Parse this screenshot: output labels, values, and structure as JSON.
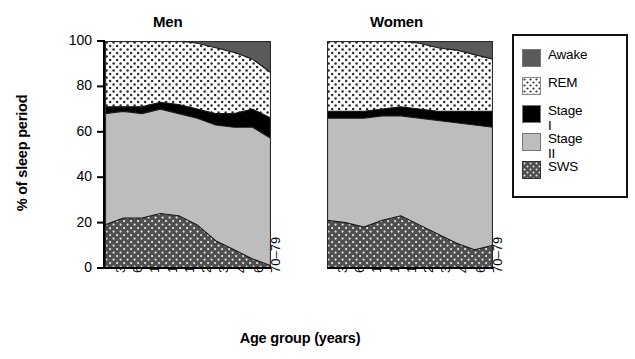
{
  "chart_data": {
    "type": "area",
    "title": "",
    "xlabel": "Age group (years)",
    "ylabel": "% of sleep period",
    "ylim": [
      0,
      100
    ],
    "yticks": [
      0,
      20,
      40,
      60,
      80,
      100
    ],
    "grid": false,
    "legend_position": "right",
    "stack_order": [
      "SWS",
      "Stage II",
      "Stage I",
      "REM",
      "Awake"
    ],
    "categories": [
      "3–5",
      "6–9",
      "10–12",
      "13–15",
      "16–19",
      "20–29",
      "30–39",
      "40–59",
      "60–69",
      "70–79"
    ],
    "panels": [
      {
        "name": "Men",
        "series": [
          {
            "name": "SWS",
            "values": [
              19,
              22,
              22,
              24,
              23,
              19,
              12,
              8,
              4,
              1
            ]
          },
          {
            "name": "Stage II",
            "values": [
              49,
              47,
              46,
              46,
              45,
              47,
              51,
              54,
              58,
              56
            ]
          },
          {
            "name": "Stage I",
            "values": [
              3,
              3,
              3,
              3,
              4,
              4,
              5,
              6,
              8,
              9
            ]
          },
          {
            "name": "REM",
            "values": [
              29,
              28,
              29,
              27,
              28,
              29,
              29,
              27,
              22,
              20
            ]
          },
          {
            "name": "Awake",
            "values": [
              0,
              0,
              0,
              0,
              0,
              1,
              3,
              5,
              8,
              14
            ]
          }
        ],
        "boundaries": {
          "sws_top": [
            19,
            22,
            22,
            24,
            23,
            19,
            12,
            8,
            4,
            1
          ],
          "stage2_top": [
            68,
            69,
            68,
            70,
            68,
            66,
            63,
            62,
            62,
            57
          ],
          "stage1_top": [
            71,
            71,
            71,
            73,
            72,
            70,
            68,
            68,
            70,
            66
          ],
          "rem_top": [
            100,
            100,
            100,
            100,
            100,
            99,
            97,
            95,
            92,
            86
          ]
        }
      },
      {
        "name": "Women",
        "series": [
          {
            "name": "SWS",
            "values": [
              21,
              20,
              18,
              21,
              23,
              19,
              15,
              11,
              8,
              10
            ]
          },
          {
            "name": "Stage II",
            "values": [
              45,
              46,
              48,
              46,
              44,
              47,
              50,
              53,
              55,
              52
            ]
          },
          {
            "name": "Stage I",
            "values": [
              3,
              3,
              3,
              3,
              4,
              4,
              4,
              5,
              6,
              7
            ]
          },
          {
            "name": "REM",
            "values": [
              31,
              31,
              31,
              30,
              29,
              29,
              28,
              27,
              25,
              23
            ]
          },
          {
            "name": "Awake",
            "values": [
              0,
              0,
              0,
              0,
              0,
              1,
              3,
              4,
              6,
              8
            ]
          }
        ],
        "boundaries": {
          "sws_top": [
            21,
            20,
            18,
            21,
            23,
            19,
            15,
            11,
            8,
            10
          ],
          "stage2_top": [
            66,
            66,
            66,
            67,
            67,
            66,
            65,
            64,
            63,
            62
          ],
          "stage1_top": [
            69,
            69,
            69,
            70,
            71,
            70,
            69,
            69,
            69,
            69
          ],
          "rem_top": [
            100,
            100,
            100,
            100,
            100,
            99,
            97,
            96,
            94,
            92
          ]
        }
      }
    ],
    "legend": [
      {
        "label": "Awake",
        "swatch": "dark-gray-solid",
        "color": "#5a5a5a"
      },
      {
        "label": "REM",
        "swatch": "white-dotted",
        "color": "#ffffff"
      },
      {
        "label": "Stage I",
        "swatch": "black-solid",
        "color": "#000000"
      },
      {
        "label": "Stage II",
        "swatch": "light-gray-solid",
        "color": "#bdbdbd"
      },
      {
        "label": "SWS",
        "swatch": "dark-gray-dotted",
        "color": "#4f4f4f"
      }
    ]
  },
  "figure": {
    "panel_titles": {
      "men": "Men",
      "women": "Women"
    },
    "axis": {
      "y_label": "% of sleep period",
      "x_label": "Age group (years)",
      "y_ticks": [
        "0",
        "20",
        "40",
        "60",
        "80",
        "100"
      ],
      "x_ticks": [
        "3–5",
        "6–9",
        "10–12",
        "13–15",
        "16–19",
        "20–29",
        "30–39",
        "40–59",
        "60–69",
        "70–79"
      ]
    },
    "legend_items": [
      "Awake",
      "REM",
      "Stage I",
      "Stage II",
      "SWS"
    ]
  }
}
